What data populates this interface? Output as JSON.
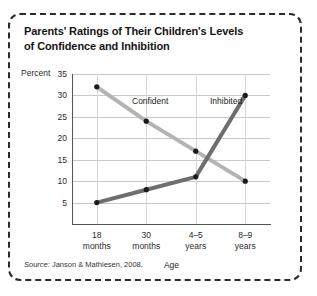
{
  "figure": {
    "title_line1": "Parents' Ratings of Their Children's Levels",
    "title_line2": "of Confidence and Inhibition",
    "percent_axis_label": "Percent",
    "source_prefix": "Source:",
    "source_text": "Janson & Mathiesen, 2008."
  },
  "chart_data": {
    "type": "line",
    "title": "Parents' Ratings of Their Children's Levels of Confidence and Inhibition",
    "xlabel": "Age",
    "ylabel": "Percent",
    "categories": [
      "18 months",
      "30 months",
      "4–5 years",
      "8–9 years"
    ],
    "category_lines": [
      [
        "18",
        "months"
      ],
      [
        "30",
        "months"
      ],
      [
        "4–5",
        "years"
      ],
      [
        "8–9",
        "years"
      ]
    ],
    "ylim": [
      0,
      35
    ],
    "yticks": [
      5,
      10,
      15,
      20,
      25,
      30,
      35
    ],
    "ytick_labels": [
      "5",
      "10",
      "15",
      "20",
      "25",
      "30",
      "35"
    ],
    "grid": true,
    "legend_position": "inline-annotation",
    "series": [
      {
        "name": "Confident",
        "values": [
          32,
          24,
          17,
          10
        ],
        "color": "#b3b3b3",
        "marker_color": "#1a1a1a"
      },
      {
        "name": "Inhibited",
        "values": [
          5,
          8,
          11,
          30
        ],
        "color": "#6e6e6e",
        "marker_color": "#1a1a1a"
      }
    ],
    "annotations": [
      {
        "text": "Confident",
        "series": "Confident"
      },
      {
        "text": "Inhibited",
        "series": "Inhibited"
      }
    ]
  }
}
